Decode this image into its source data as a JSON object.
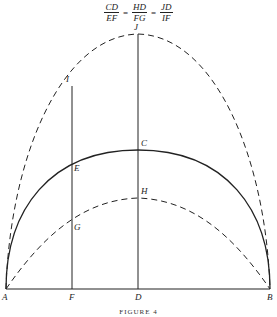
{
  "formula": {
    "terms": [
      {
        "num": "CD",
        "den": "EF"
      },
      {
        "num": "HD",
        "den": "FG"
      },
      {
        "num": "JD",
        "den": "IF"
      }
    ],
    "equals": "="
  },
  "diagram": {
    "points": {
      "A": "A",
      "B": "B",
      "C": "C",
      "D": "D",
      "E": "E",
      "F": "F",
      "G": "G",
      "H": "H",
      "I": "I",
      "J": "J"
    },
    "curves": [
      {
        "name": "outer-dashed-arch",
        "style": "dashed",
        "through": [
          "A",
          "I",
          "J",
          "B"
        ]
      },
      {
        "name": "middle-solid-arch",
        "style": "solid",
        "through": [
          "A",
          "E",
          "C",
          "B"
        ]
      },
      {
        "name": "inner-dashed-arch",
        "style": "dashed",
        "through": [
          "A",
          "G",
          "H",
          "B"
        ]
      }
    ],
    "lines": [
      {
        "name": "baseline",
        "from": "A",
        "to": "B"
      },
      {
        "name": "vertical-IF",
        "from": "I",
        "to": "F"
      },
      {
        "name": "vertical-JD",
        "from": "J",
        "to": "D"
      }
    ],
    "stroke_color": "#222222"
  },
  "caption": "FIGURE 4"
}
